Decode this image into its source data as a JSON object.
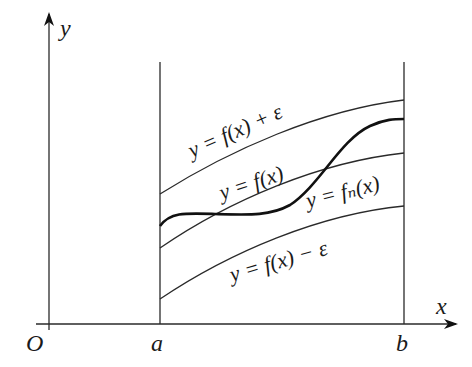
{
  "diagram": {
    "type": "function-band",
    "axes": {
      "x_label": "x",
      "y_label": "y",
      "origin_label": "O"
    },
    "interval": {
      "left_label": "a",
      "right_label": "b"
    },
    "curves": [
      {
        "id": "upper",
        "label": "y = f(x) + ε",
        "style": "thin"
      },
      {
        "id": "f",
        "label": "y = f(x)",
        "style": "thin"
      },
      {
        "id": "fn",
        "label": "y = fₙ(x)",
        "style": "thick"
      },
      {
        "id": "lower",
        "label": "y = f(x) − ε",
        "style": "thin"
      }
    ],
    "colors": {
      "line": "#2a2a2a",
      "background": "#ffffff"
    }
  }
}
